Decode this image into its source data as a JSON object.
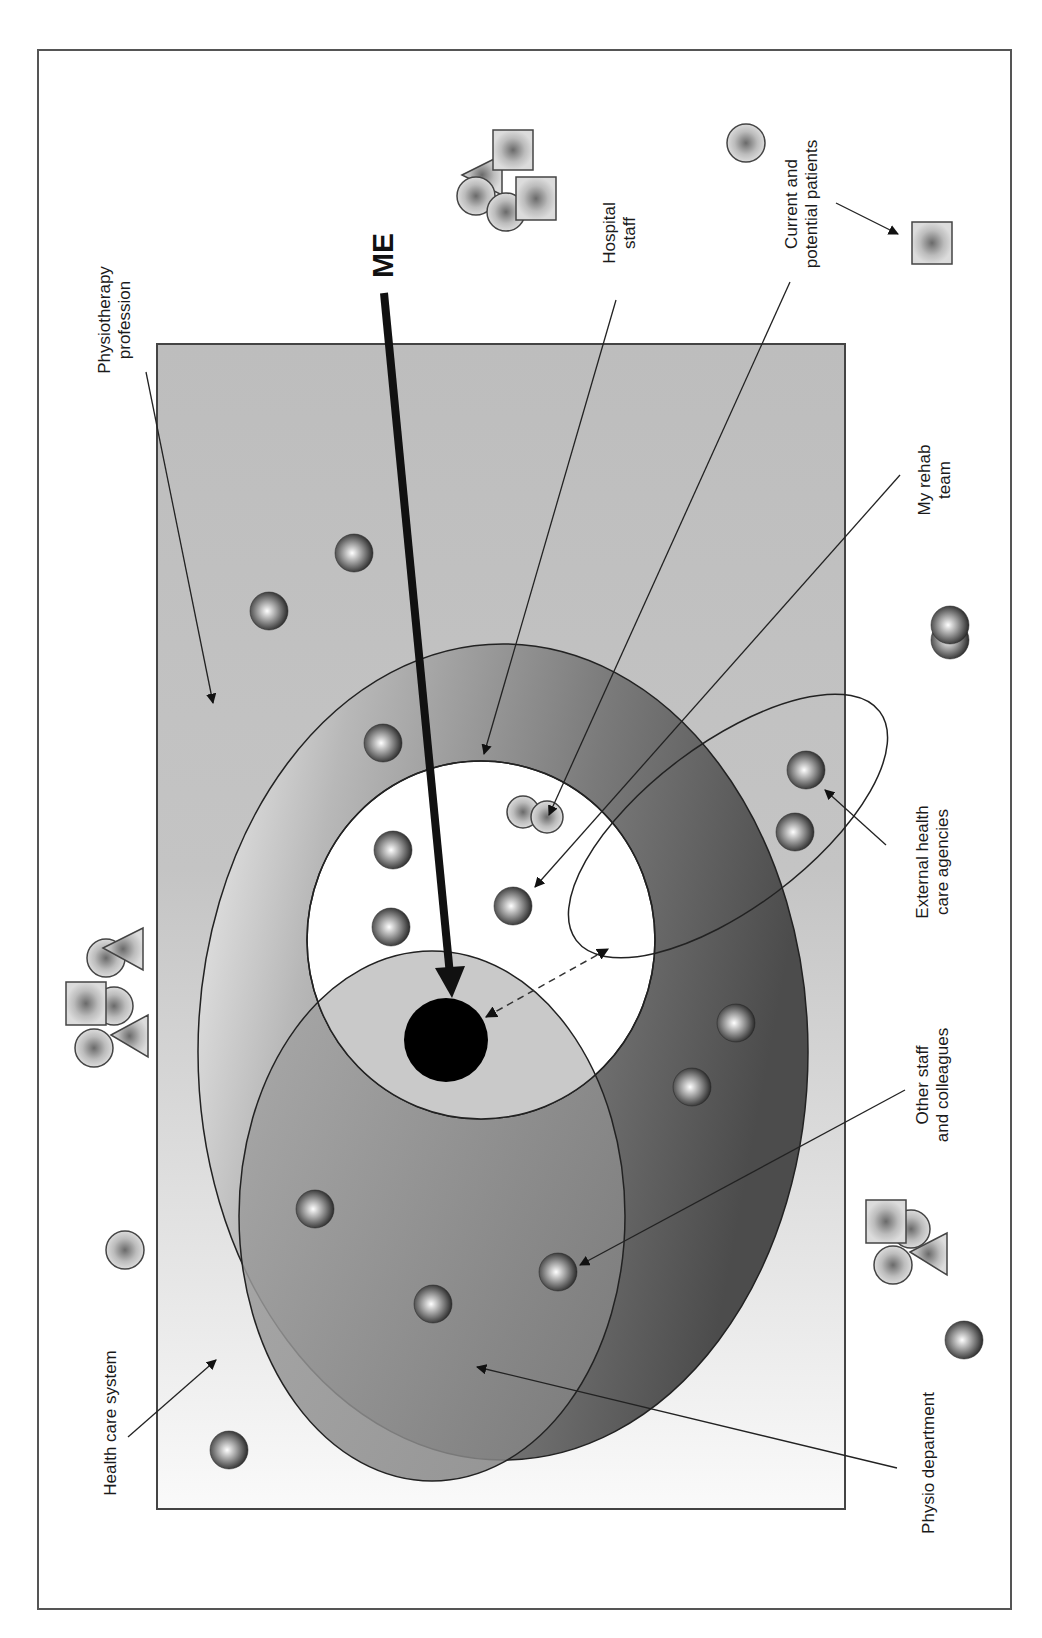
{
  "diagram": {
    "center_label": "ME",
    "labels": {
      "physiotherapy_profession": [
        "Physiotherapy",
        "profession"
      ],
      "hospital_staff": [
        "Hospital",
        "staff"
      ],
      "current_potential_patients": [
        "Current and",
        "potential patients"
      ],
      "my_rehab_team": [
        "My rehab",
        "team"
      ],
      "external_agencies": [
        "External health",
        "care agencies"
      ],
      "other_staff": [
        "Other staff",
        "and colleagues"
      ],
      "physio_department": [
        "Physio department"
      ],
      "health_care_system": [
        "Health care system"
      ]
    },
    "regions": [
      {
        "name": "Health care system",
        "shape": "outer rectangle"
      },
      {
        "name": "Physiotherapy profession",
        "shape": "inner shaded rectangle"
      },
      {
        "name": "Hospital staff",
        "shape": "large ellipse"
      },
      {
        "name": "Physio department",
        "shape": "lower ellipse"
      },
      {
        "name": "My rehab team",
        "shape": "white circle"
      },
      {
        "name": "External health care agencies",
        "shape": "tilted ellipse"
      },
      {
        "name": "ME",
        "shape": "black dot"
      }
    ],
    "colors": {
      "frame": "#555555",
      "profession_fill_top": "#bdbdbd",
      "profession_fill_bottom": "#f7f7f7",
      "hospital_dark": "#5a5a5a",
      "physio_dept": "#8c8c8c",
      "rehab_team": "#ffffff",
      "me_dot": "#000000"
    }
  }
}
